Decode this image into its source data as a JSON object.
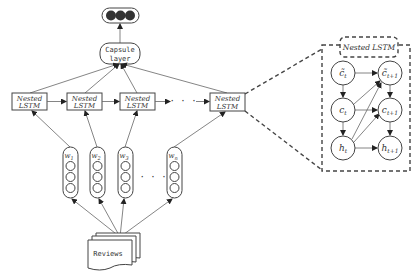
{
  "diagram": {
    "output": {
      "label": "",
      "node_count": 3,
      "node_color": "#333333"
    },
    "capsule": {
      "line1": "Capsule",
      "line2": "layer"
    },
    "lstm_cells": [
      {
        "line1": "Nested",
        "line2": "LSTM"
      },
      {
        "line1": "Nested",
        "line2": "LSTM"
      },
      {
        "line1": "Nested",
        "line2": "LSTM"
      },
      {
        "line1": "Nested",
        "line2": "LSTM"
      }
    ],
    "lstm_ellipsis": "· · ·",
    "words": [
      {
        "label": "w",
        "sub": "1"
      },
      {
        "label": "w",
        "sub": "2"
      },
      {
        "label": "w",
        "sub": "3"
      },
      {
        "label": "w",
        "sub": "n"
      }
    ],
    "word_ellipsis": "· · ·",
    "input": {
      "label": "Reviews"
    },
    "detail": {
      "title": "Nested LSTM",
      "nodes": {
        "c_tilde_t": {
          "base": "c̃",
          "sub": "t"
        },
        "c_tilde_t1": {
          "base": "c̃",
          "sub": "t+1"
        },
        "c_t": {
          "base": "c",
          "sub": "t"
        },
        "c_t1": {
          "base": "c",
          "sub": "t+1"
        },
        "h_t": {
          "base": "h",
          "sub": "t"
        },
        "h_t1": {
          "base": "h",
          "sub": "t+1"
        }
      }
    },
    "colors": {
      "stroke": "#444444",
      "line": "#666666",
      "background": "#ffffff"
    }
  }
}
